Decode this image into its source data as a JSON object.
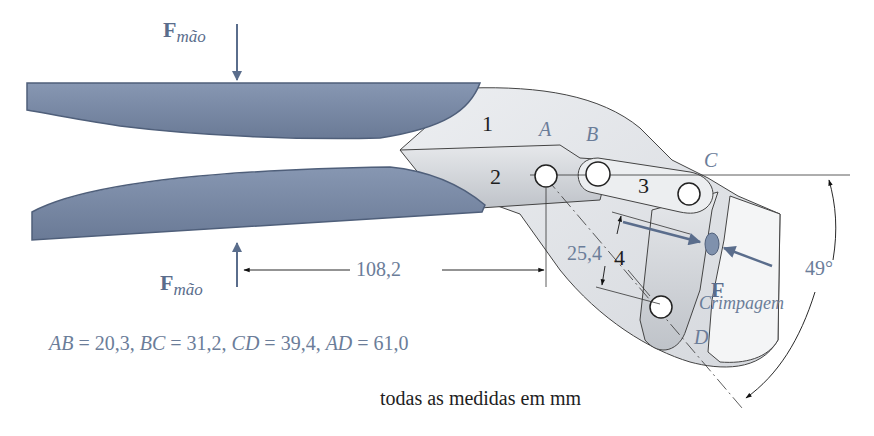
{
  "diagram": {
    "type": "linkage mechanism - crimping tool (four-bar)",
    "colors": {
      "handle_fill": "#7a8aa6",
      "handle_stroke": "#4f5f7a",
      "link_fill": "#e3e5e8",
      "link_dark": "#c4c7cc",
      "line": "#333333",
      "label_blue": "#6b7d99",
      "arrow_blue": "#5a6d8c"
    },
    "forces": {
      "hand_top": {
        "symbol": "F",
        "subscript": "mão"
      },
      "hand_bottom": {
        "symbol": "F",
        "subscript": "mão"
      },
      "crimp": {
        "symbol": "F",
        "subscript": "Crimpagem"
      }
    },
    "links": [
      {
        "id": "1",
        "label": "1"
      },
      {
        "id": "2",
        "label": "2"
      },
      {
        "id": "3",
        "label": "3"
      },
      {
        "id": "4",
        "label": "4"
      }
    ],
    "joints": [
      {
        "id": "A",
        "label": "A"
      },
      {
        "id": "B",
        "label": "B"
      },
      {
        "id": "C",
        "label": "C"
      },
      {
        "id": "D",
        "label": "D"
      }
    ],
    "dimensions": {
      "hand_to_A": "108,2",
      "offset": "25,4",
      "angle": "49°"
    },
    "lengths_text": {
      "ab_name": "AB",
      "ab_val": " = 20,3, ",
      "bc_name": "BC",
      "bc_val": " = 31,2, ",
      "cd_name": "CD",
      "cd_val": " = 39,4, ",
      "ad_name": "AD",
      "ad_val": " = 61,0"
    },
    "units_note": "todas as medidas em mm"
  }
}
